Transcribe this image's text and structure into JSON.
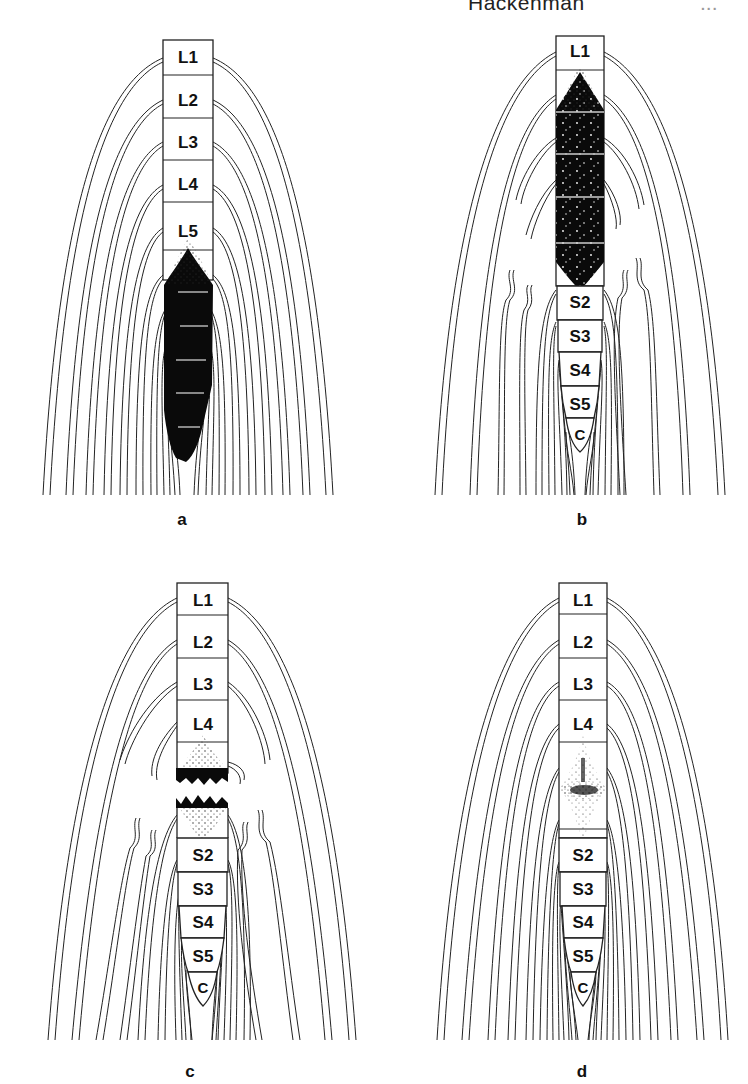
{
  "page": {
    "running_head": "Hackenman",
    "page_number": "..."
  },
  "figure": {
    "panels": [
      {
        "id": "a",
        "caption": "a",
        "vertebrae": [
          "L1",
          "L2",
          "L3",
          "L4",
          "L5"
        ],
        "lesion": "dense block from below L5 extending caudally (complete block, tapered tail)"
      },
      {
        "id": "b",
        "caption": "b",
        "vertebrae": [
          "L1",
          "S2",
          "S3",
          "S4",
          "S5",
          "C"
        ],
        "lesion": "dense block spanning L2–S1 with speckled spots; nerve roots truncated"
      },
      {
        "id": "c",
        "caption": "c",
        "vertebrae": [
          "L1",
          "L2",
          "L3",
          "L4",
          "S2",
          "S3",
          "S4",
          "S5",
          "C"
        ],
        "lesion": "two jagged dark bands with a gap at L5–S1 level; roots truncated"
      },
      {
        "id": "d",
        "caption": "d",
        "vertebrae": [
          "L1",
          "L2",
          "L3",
          "L4",
          "S2",
          "S3",
          "S4",
          "S5",
          "C"
        ],
        "lesion": "diffuse stippled opacity at L5–S1 level"
      }
    ]
  }
}
